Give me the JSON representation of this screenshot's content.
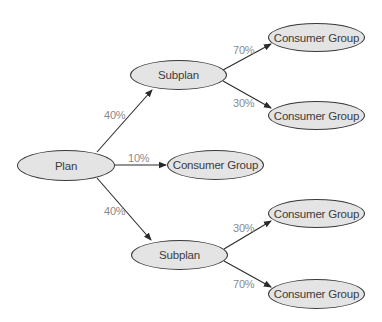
{
  "diagram": {
    "type": "tree",
    "colors": {
      "node_fill": "#e4e4e4",
      "node_border": "#3a3a3a",
      "edge": "#2a2a2a",
      "label_text": "#3c3c3c",
      "percent_text": "#8a8a8a"
    },
    "nodes": [
      {
        "id": "plan",
        "label": "Plan"
      },
      {
        "id": "subplan-top",
        "label": "Subplan"
      },
      {
        "id": "subplan-bottom",
        "label": "Subplan"
      },
      {
        "id": "consumer-group-1",
        "label": "Consumer Group"
      },
      {
        "id": "consumer-group-2",
        "label": "Consumer Group"
      },
      {
        "id": "consumer-group-3",
        "label": "Consumer Group"
      },
      {
        "id": "consumer-group-4",
        "label": "Consumer Group"
      },
      {
        "id": "consumer-group-5",
        "label": "Consumer Group"
      }
    ],
    "edges": [
      {
        "from": "plan",
        "to": "subplan-top",
        "label": "40%"
      },
      {
        "from": "plan",
        "to": "consumer-group-3",
        "label": "10%"
      },
      {
        "from": "plan",
        "to": "subplan-bottom",
        "label": "40%"
      },
      {
        "from": "subplan-top",
        "to": "consumer-group-1",
        "label": "70%"
      },
      {
        "from": "subplan-top",
        "to": "consumer-group-2",
        "label": "30%"
      },
      {
        "from": "subplan-bottom",
        "to": "consumer-group-4",
        "label": "30%"
      },
      {
        "from": "subplan-bottom",
        "to": "consumer-group-5",
        "label": "70%"
      }
    ]
  }
}
